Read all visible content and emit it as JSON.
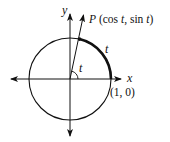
{
  "diagram": {
    "type": "unit-circle",
    "labels": {
      "y_axis": "y",
      "x_axis": "x",
      "point_P_prefix": "P",
      "point_P_coords_open": "(cos ",
      "point_P_t1": "t",
      "point_P_mid": ", sin ",
      "point_P_t2": "t",
      "point_P_close": ")",
      "angle_label": "t",
      "arc_label": "t",
      "point_one_zero": "(1, 0)"
    },
    "colors": {
      "stroke": "#111111",
      "background": "#ffffff"
    }
  }
}
